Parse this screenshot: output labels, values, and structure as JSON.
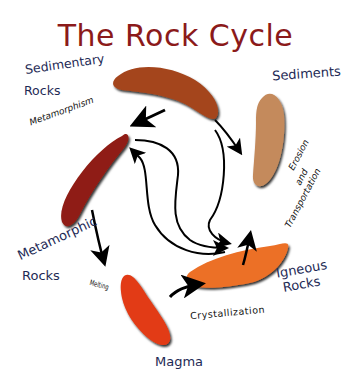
{
  "title": "The Rock Cycle",
  "nodes": {
    "sedimentary": {
      "line1": "Sedimentary",
      "line2": "Rocks",
      "color": "#a4451c"
    },
    "sediments": {
      "label": "Sediments",
      "color": "#c48a5c"
    },
    "igneous": {
      "line1": "Igneous",
      "line2": "Rocks",
      "color": "#ec6f26"
    },
    "magma": {
      "label": "Magma",
      "color": "#e23a14"
    },
    "metamorphic": {
      "line1": "Metamorphic",
      "line2": "Rocks",
      "color": "#8f1c12"
    }
  },
  "processes": {
    "metamorphism": "Metamorphism",
    "erosion": {
      "line1": "Erosion",
      "line2": "and",
      "line3": "Transportation"
    },
    "crystallization": "Crystallization",
    "melting": "Melting"
  }
}
